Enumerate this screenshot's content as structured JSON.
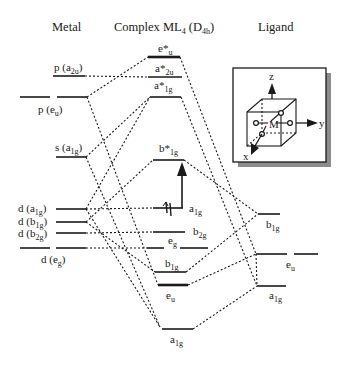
{
  "headers": {
    "metal": "Metal",
    "complex_prefix": "Complex ML",
    "complex_sub": "4",
    "complex_sym_open": " (D",
    "complex_sym_sub": "4h",
    "complex_sym_close": ")",
    "ligand": "Ligand"
  },
  "metal_levels": [
    {
      "id": "p-a2u",
      "label": "p (a",
      "sub": "2u",
      "close": ")"
    },
    {
      "id": "p-eu",
      "label": "p (e",
      "sub": "u",
      "close": ")"
    },
    {
      "id": "s-a1g",
      "label": "s (a",
      "sub": "1g",
      "close": ")"
    },
    {
      "id": "d-a1g",
      "label": "d (a",
      "sub": "1g",
      "close": ")"
    },
    {
      "id": "d-b1g",
      "label": "d (b",
      "sub": "1g",
      "close": ")"
    },
    {
      "id": "d-b2g",
      "label": "d (b",
      "sub": "2g",
      "close": ")"
    },
    {
      "id": "d-eg",
      "label": "d (e",
      "sub": "g",
      "close": ")"
    }
  ],
  "complex_levels": [
    {
      "id": "e-star-u",
      "label": "e*",
      "sub": "u"
    },
    {
      "id": "a-star-2u",
      "label": "a*",
      "sub": "2u"
    },
    {
      "id": "a-star-1g",
      "label": "a*",
      "sub": "1g"
    },
    {
      "id": "b-star-1g",
      "label": "b*",
      "sub": "1g"
    },
    {
      "id": "a1g-homo",
      "label": "a",
      "sub": "1g"
    },
    {
      "id": "b2g",
      "label": "b",
      "sub": "2g"
    },
    {
      "id": "eg",
      "label": "e",
      "sub": "g"
    },
    {
      "id": "b1g",
      "label": "b",
      "sub": "1g"
    },
    {
      "id": "eu",
      "label": "e",
      "sub": "u"
    },
    {
      "id": "a1g-bottom",
      "label": "a",
      "sub": "1g"
    }
  ],
  "ligand_levels": [
    {
      "id": "lig-b1g",
      "label": "b",
      "sub": "1g"
    },
    {
      "id": "lig-eu",
      "label": "e",
      "sub": "u"
    },
    {
      "id": "lig-a1g",
      "label": "a",
      "sub": "1g"
    }
  ],
  "inset": {
    "axis_z": "z",
    "axis_y": "y",
    "axis_x": "x",
    "metal": "M"
  }
}
